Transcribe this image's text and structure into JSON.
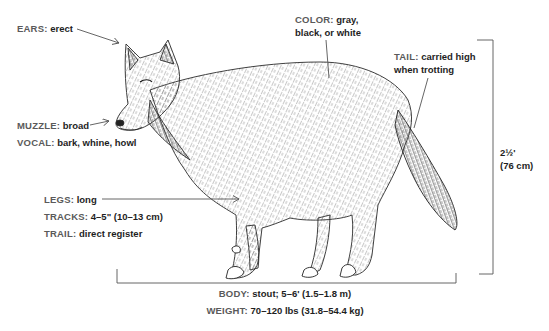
{
  "diagram": {
    "labels": {
      "ears": {
        "key": "EARS:",
        "value": "erect"
      },
      "color": {
        "key": "COLOR:",
        "value_line1": "gray,",
        "value_line2": "black, or white"
      },
      "tail": {
        "key": "TAIL:",
        "value_line1": "carried high",
        "value_line2": "when trotting"
      },
      "muzzle": {
        "key": "MUZZLE:",
        "value": "broad"
      },
      "vocal": {
        "key": "VOCAL:",
        "value": "bark, whine, howl"
      },
      "height": {
        "line1": "2½'",
        "line2": "(76 cm)"
      },
      "legs": {
        "key": "LEGS:",
        "value": "long"
      },
      "tracks": {
        "key": "TRACKS:",
        "value": "4–5\" (10–13 cm)"
      },
      "trail": {
        "key": "TRAIL:",
        "value": "direct register"
      },
      "body": {
        "key": "BODY:",
        "value": "stout; 5–6' (1.5–1.8 m)"
      },
      "weight": {
        "key": "WEIGHT:",
        "value": "70–120 lbs (31.8–54.4 kg)"
      }
    },
    "colors": {
      "label_key": "#5a5a5a",
      "label_value": "#1e1e1e",
      "line": "#555555",
      "ink": "#2a2a2a"
    }
  }
}
